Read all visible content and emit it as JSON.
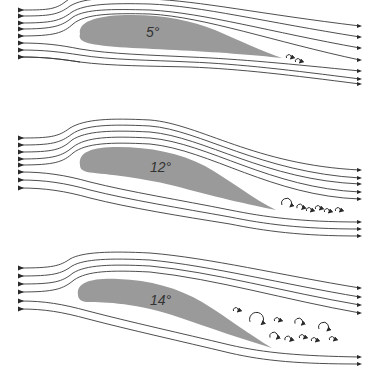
{
  "colors": {
    "airfoil_fill": "#9a9a9a",
    "streamline": "#3a3a3a",
    "background": "#ffffff"
  },
  "panels": [
    {
      "id": "panel-5",
      "angle_label": "5°",
      "label_pos": [
        146,
        37
      ],
      "airfoil": "M 80 34 C 78 22, 95 16, 125 15 C 160 14, 190 20, 215 30 C 240 41, 262 51, 282 58 C 255 55, 215 52, 175 50 C 135 48, 98 47, 85 42 C 80 40, 79 37, 80 34 Z",
      "streamlines": [
        "M 20 10 C 45 10, 55 10, 65 2 C 70 -2, 75 -4, 80 -5",
        "M 20 16 C 50 16, 58 15, 70 6 C 85 -3, 110 -2, 150 -1 C 200 1, 260 14, 360 26",
        "M 20 23 C 52 23, 60 21, 72 12 C 85 4, 110 3, 150 4 C 200 6, 265 22, 360 37",
        "M 20 29 C 54 29, 62 26, 73 17 C 86 9, 110 9, 150 10 C 205 13, 270 32, 360 48",
        "M 20 36 C 55 36, 63 33, 73 24 C 85 14, 110 13, 150 14 C 205 17, 275 42, 360 60",
        "M 20 43 C 45 43, 60 45, 80 49 C 110 54, 150 55, 190 57 C 240 59, 290 64, 360 71",
        "M 20 50 C 45 50, 60 52, 80 55 C 110 60, 150 60, 190 62 C 240 64, 290 70, 360 79",
        "M 20 57 C 45 57, 60 59, 80 62 C 110 66, 150 66, 190 67 C 240 69, 290 75, 360 84",
        "M 20 57 C 45 57, 60 59, 80 62"
      ],
      "arrow_heads_in": [
        [
          22,
          10
        ],
        [
          22,
          16
        ],
        [
          22,
          23
        ],
        [
          22,
          29
        ],
        [
          22,
          36
        ],
        [
          22,
          43
        ],
        [
          22,
          50
        ],
        [
          22,
          57
        ]
      ],
      "arrow_heads_out": [
        [
          360,
          26
        ],
        [
          360,
          37
        ],
        [
          360,
          48
        ],
        [
          360,
          60
        ],
        [
          360,
          71
        ],
        [
          360,
          79
        ],
        [
          360,
          84
        ]
      ],
      "eddies": [
        {
          "cx": 289,
          "cy": 57,
          "r": 2.5
        },
        {
          "cx": 298,
          "cy": 61,
          "r": 2.5
        }
      ]
    },
    {
      "id": "panel-12",
      "angle_label": "12°",
      "label_pos": [
        150,
        172
      ],
      "airfoil": "M 80 165 C 78 152, 92 147, 118 147 C 150 147, 180 153, 205 166 C 230 180, 255 200, 276 210 C 250 205, 212 196, 175 186 C 135 176, 100 174, 87 172 C 81 170, 80 168, 80 165 Z",
      "streamlines": [
        "M 20 138 C 50 138, 58 137, 70 128 C 85 119, 110 118, 150 120 C 200 124, 255 165, 360 170",
        "M 20 145 C 52 145, 60 143, 72 134 C 85 125, 110 124, 150 126 C 200 130, 260 172, 360 178",
        "M 20 152 C 53 152, 61 150, 72 140 C 86 131, 110 130, 150 132 C 205 137, 265 180, 360 184",
        "M 20 159 C 54 159, 62 156, 73 147 C 86 137, 110 136, 150 138 C 208 143, 270 188, 360 192",
        "M 20 165 C 55 165, 63 162, 73 153 C 86 143, 110 142, 150 144 C 210 150, 272 196, 360 199",
        "M 20 172 C 45 172, 65 175, 90 182 C 130 192, 180 200, 230 210 C 265 217, 300 222, 360 222",
        "M 20 180 C 45 180, 65 183, 90 190 C 130 200, 180 208, 230 217 C 265 224, 300 229, 360 229",
        "M 20 188 C 45 188, 65 191, 90 198 C 130 208, 180 216, 230 224 C 265 231, 300 236, 360 236"
      ],
      "arrow_heads_in": [
        [
          22,
          138
        ],
        [
          22,
          145
        ],
        [
          22,
          152
        ],
        [
          22,
          159
        ],
        [
          22,
          165
        ],
        [
          22,
          172
        ],
        [
          22,
          180
        ],
        [
          22,
          188
        ]
      ],
      "arrow_heads_out": [
        [
          360,
          170
        ],
        [
          360,
          178
        ],
        [
          360,
          184
        ],
        [
          360,
          192
        ],
        [
          360,
          199
        ],
        [
          360,
          222
        ],
        [
          360,
          229
        ],
        [
          360,
          236
        ]
      ],
      "eddies": [
        {
          "cx": 287,
          "cy": 203,
          "r": 5
        },
        {
          "cx": 300,
          "cy": 207,
          "r": 3
        },
        {
          "cx": 309,
          "cy": 210,
          "r": 2.5
        },
        {
          "cx": 318,
          "cy": 208,
          "r": 2.5
        },
        {
          "cx": 327,
          "cy": 211,
          "r": 2.5
        },
        {
          "cx": 338,
          "cy": 210,
          "r": 2.5
        }
      ]
    },
    {
      "id": "panel-14",
      "angle_label": "14°",
      "label_pos": [
        150,
        305
      ],
      "airfoil": "M 78 295 C 76 282, 92 278, 118 279 C 150 280, 178 288, 202 302 C 228 318, 250 335, 272 348 C 245 340, 210 328, 172 315 C 132 302, 98 302, 86 302 C 80 301, 78 298, 78 295 Z",
      "streamlines": [
        "M 20 268 C 52 268, 60 266, 70 259 C 82 252, 110 251, 150 253 C 210 258, 280 275, 360 288",
        "M 20 276 C 53 276, 61 274, 72 266 C 84 259, 110 258, 150 260 C 212 266, 282 284, 360 297",
        "M 20 284 C 54 284, 62 282, 73 273 C 86 265, 110 264, 150 266 C 214 272, 284 292, 360 305",
        "M 20 292 C 55 292, 63 289, 74 280 C 87 271, 110 270, 150 272 C 216 279, 286 300, 360 313",
        "M 20 301 C 45 301, 62 304, 88 311 C 130 322, 180 333, 230 345 C 265 353, 300 356, 360 357",
        "M 20 309 C 45 309, 62 312, 88 319 C 130 330, 180 341, 230 353 C 265 361, 300 364, 360 364"
      ],
      "arrow_heads_in": [
        [
          22,
          268
        ],
        [
          22,
          276
        ],
        [
          22,
          284
        ],
        [
          22,
          292
        ],
        [
          22,
          301
        ],
        [
          22,
          309
        ]
      ],
      "arrow_heads_out": [
        [
          360,
          288
        ],
        [
          360,
          297
        ],
        [
          360,
          305
        ],
        [
          360,
          313
        ],
        [
          360,
          357
        ],
        [
          360,
          364
        ]
      ],
      "eddies": [
        {
          "cx": 236,
          "cy": 310,
          "r": 2.5
        },
        {
          "cx": 257,
          "cy": 319,
          "r": 7
        },
        {
          "cx": 277,
          "cy": 320,
          "r": 2.5
        },
        {
          "cx": 299,
          "cy": 322,
          "r": 4
        },
        {
          "cx": 324,
          "cy": 327,
          "r": 5
        },
        {
          "cx": 274,
          "cy": 336,
          "r": 4
        },
        {
          "cx": 288,
          "cy": 339,
          "r": 3
        },
        {
          "cx": 302,
          "cy": 337,
          "r": 2.5
        },
        {
          "cx": 314,
          "cy": 340,
          "r": 2.5
        },
        {
          "cx": 332,
          "cy": 339,
          "r": 2.5
        }
      ]
    }
  ]
}
